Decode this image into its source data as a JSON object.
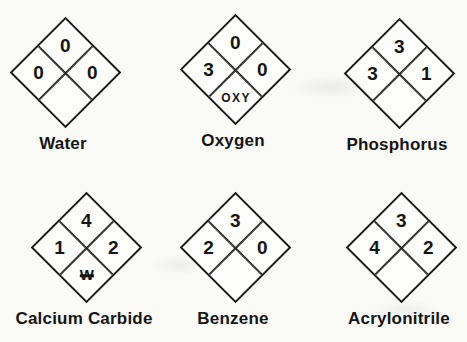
{
  "page": {
    "background": "#f9f9f6",
    "ink": "#1b1b1b",
    "description_type": "nfpa-hazard-diamond-figure"
  },
  "figures": [
    {
      "label": "Water",
      "top": "0",
      "left": "0",
      "right": "0",
      "bottom": ""
    },
    {
      "label": "Oxygen",
      "top": "0",
      "left": "3",
      "right": "0",
      "bottom": "OXY"
    },
    {
      "label": "Phosphorus",
      "top": "3",
      "left": "3",
      "right": "1",
      "bottom": ""
    },
    {
      "label": "Calcium Carbide",
      "top": "4",
      "left": "1",
      "right": "2",
      "bottom": "W"
    },
    {
      "label": "Benzene",
      "top": "3",
      "left": "2",
      "right": "0",
      "bottom": ""
    },
    {
      "label": "Acrylonitrile",
      "top": "3",
      "left": "4",
      "right": "2",
      "bottom": ""
    }
  ]
}
